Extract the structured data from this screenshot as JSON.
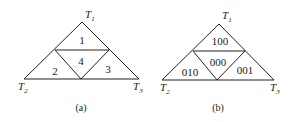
{
  "figures": [
    {
      "caption": "(a)",
      "vertices": {
        "top": {
          "name": "T",
          "sub": "1"
        },
        "left": {
          "name": "T",
          "sub": "2"
        },
        "right": {
          "name": "T",
          "sub": "3"
        }
      },
      "regions": {
        "top": "1",
        "left": "2",
        "center": "4",
        "right": "3"
      }
    },
    {
      "caption": "(b)",
      "vertices": {
        "top": {
          "name": "T",
          "sub": "1"
        },
        "left": {
          "name": "T",
          "sub": "2"
        },
        "right": {
          "name": "T",
          "sub": "3"
        }
      },
      "regions": {
        "top": "100",
        "left": "010",
        "center": "000",
        "right": "001"
      }
    }
  ],
  "colors": {
    "line": "#222222",
    "background": "#ffffff"
  }
}
